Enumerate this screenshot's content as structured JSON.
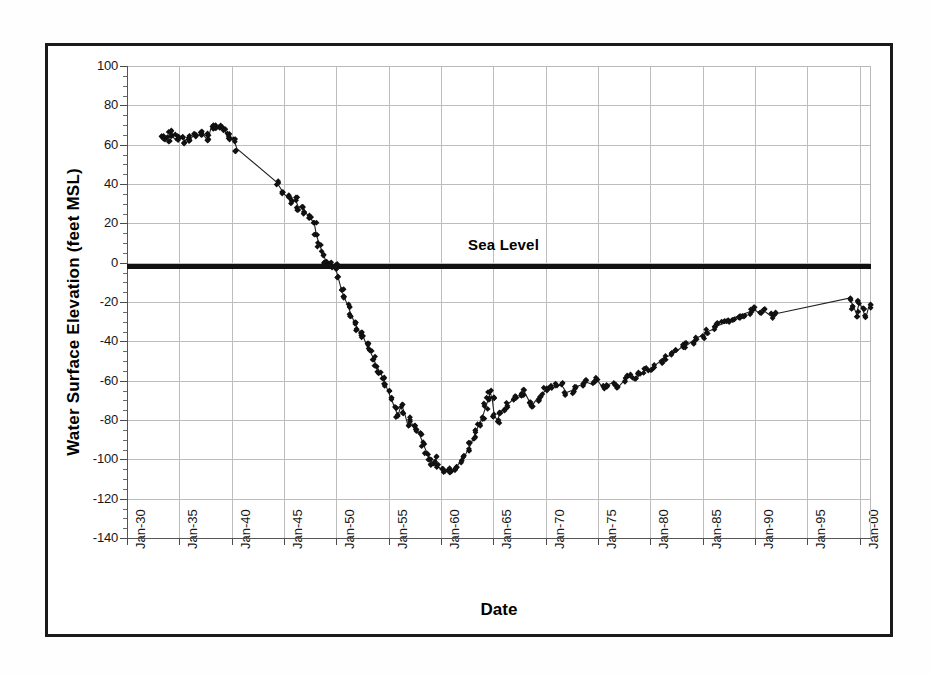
{
  "chart_data": {
    "type": "line",
    "title": "",
    "xlabel": "Date",
    "ylabel": "Water Surface Elevation (feet MSL)",
    "ylim": [
      -140,
      100
    ],
    "xlim": [
      "Jan-30",
      "Jan-01"
    ],
    "grid": true,
    "legend": "none",
    "y_ticks": [
      100,
      80,
      60,
      40,
      20,
      0,
      -20,
      -40,
      -60,
      -80,
      -100,
      -120,
      -140
    ],
    "y_tick_labels": [
      "100",
      "80",
      "60",
      "40",
      "20",
      "0",
      "-20",
      "-40",
      "-60",
      "-80",
      "-100",
      "-120",
      "-140"
    ],
    "y_minor_tick_interval": 5,
    "x_ticks": [
      "Jan-30",
      "Jan-35",
      "Jan-40",
      "Jan-45",
      "Jan-50",
      "Jan-55",
      "Jan-60",
      "Jan-65",
      "Jan-70",
      "Jan-75",
      "Jan-80",
      "Jan-85",
      "Jan-90",
      "Jan-95",
      "Jan-00"
    ],
    "x_tick_years": [
      1930,
      1935,
      1940,
      1945,
      1950,
      1955,
      1960,
      1965,
      1970,
      1975,
      1980,
      1985,
      1990,
      1995,
      2000
    ],
    "annotations": [
      {
        "text": "Sea Level",
        "y": 0,
        "style": "thick-horizontal-rule-with-label"
      }
    ],
    "marker": "filled-diamond",
    "marker_color": "#111111",
    "line_color": "#222222",
    "series": [
      {
        "name": "Water Surface Elevation",
        "x": [
          1933.3,
          1933.6,
          1933.9,
          1934.1,
          1934.4,
          1934.7,
          1935.0,
          1935.3,
          1935.6,
          1935.9,
          1936.1,
          1936.4,
          1936.7,
          1937.0,
          1937.3,
          1937.6,
          1937.9,
          1938.1,
          1938.4,
          1938.7,
          1939.0,
          1939.3,
          1939.6,
          1939.9,
          1940.2,
          1940.5,
          1944.3,
          1945.0,
          1945.4,
          1945.8,
          1946.1,
          1946.4,
          1946.7,
          1947.0,
          1947.3,
          1947.6,
          1947.9,
          1948.1,
          1948.4,
          1948.7,
          1949.0,
          1949.3,
          1949.6,
          1949.9,
          1950.2,
          1950.5,
          1950.8,
          1951.1,
          1951.4,
          1951.7,
          1952.0,
          1952.3,
          1952.6,
          1952.9,
          1953.2,
          1953.5,
          1953.8,
          1954.1,
          1954.4,
          1954.7,
          1955.0,
          1955.3,
          1955.6,
          1955.9,
          1956.2,
          1956.5,
          1956.8,
          1957.1,
          1957.4,
          1957.7,
          1958.0,
          1958.3,
          1958.6,
          1958.9,
          1959.2,
          1959.5,
          1959.8,
          1960.1,
          1960.4,
          1960.7,
          1961.0,
          1961.3,
          1961.6,
          1961.9,
          1962.2,
          1962.5,
          1962.8,
          1963.1,
          1963.4,
          1963.7,
          1964.0,
          1964.3,
          1964.5,
          1964.7,
          1964.9,
          1965.1,
          1965.4,
          1965.7,
          1966.0,
          1966.4,
          1966.8,
          1967.2,
          1967.6,
          1968.0,
          1968.4,
          1968.8,
          1969.2,
          1969.6,
          1970.0,
          1970.5,
          1971.0,
          1971.5,
          1972.0,
          1972.5,
          1973.0,
          1973.5,
          1974.0,
          1974.5,
          1975.0,
          1975.5,
          1976.0,
          1976.5,
          1977.0,
          1977.5,
          1978.0,
          1978.5,
          1979.0,
          1979.5,
          1980.0,
          1980.5,
          1981.0,
          1981.5,
          1982.0,
          1982.5,
          1983.0,
          1983.5,
          1984.0,
          1984.5,
          1985.0,
          1985.5,
          1986.0,
          1986.5,
          1987.0,
          1987.5,
          1988.0,
          1988.5,
          1989.0,
          1989.5,
          1990.0,
          1990.5,
          1991.0,
          1991.5,
          1992.0,
          1999.0,
          1999.4,
          1999.7,
          2000.0,
          2000.3,
          2000.6,
          2000.9
        ],
        "y": [
          65,
          64,
          63,
          66,
          64,
          62,
          63,
          65,
          62,
          64,
          63,
          65,
          64,
          66,
          65,
          63,
          66,
          70,
          69,
          68,
          69,
          67,
          65,
          64,
          63,
          58,
          41,
          35,
          33,
          30,
          32,
          28,
          29,
          26,
          24,
          22,
          20,
          14,
          9,
          5,
          1,
          0,
          -1,
          -2,
          -8,
          -14,
          -18,
          -22,
          -26,
          -30,
          -33,
          -36,
          -38,
          -42,
          -45,
          -48,
          -52,
          -55,
          -58,
          -62,
          -66,
          -70,
          -74,
          -78,
          -72,
          -76,
          -82,
          -80,
          -84,
          -86,
          -88,
          -92,
          -96,
          -99,
          -102,
          -100,
          -104,
          -106,
          -107,
          -105,
          -106,
          -104,
          -103,
          -101,
          -99,
          -96,
          -93,
          -89,
          -85,
          -82,
          -78,
          -73,
          -70,
          -66,
          -69,
          -78,
          -80,
          -76,
          -74,
          -72,
          -70,
          -69,
          -68,
          -66,
          -70,
          -72,
          -69,
          -67,
          -65,
          -64,
          -63,
          -62,
          -66,
          -65,
          -63,
          -62,
          -61,
          -62,
          -60,
          -64,
          -62,
          -61,
          -63,
          -60,
          -58,
          -60,
          -57,
          -55,
          -54,
          -52,
          -50,
          -48,
          -47,
          -45,
          -43,
          -42,
          -40,
          -38,
          -37,
          -35,
          -34,
          -32,
          -31,
          -30,
          -28,
          -27,
          -26,
          -25,
          -24,
          -26,
          -25,
          -27,
          -26,
          -18,
          -22,
          -26,
          -20,
          -24,
          -28,
          -22
        ]
      }
    ]
  },
  "figure": {
    "y_axis_title": "Water Surface Elevation (feet MSL)",
    "x_axis_title": "Date",
    "sea_level_label": "Sea Level"
  },
  "colors": {
    "frame": "#1a1a1a",
    "grid": "#bdbdbd",
    "data": "#111111",
    "background": "#ffffff"
  }
}
